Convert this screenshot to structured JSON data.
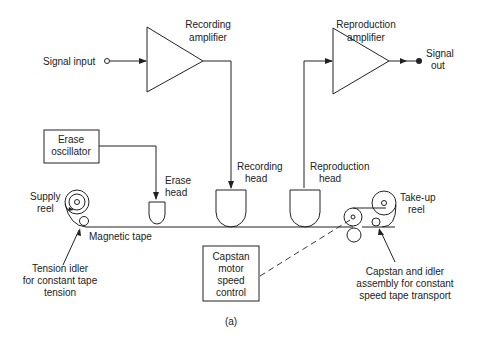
{
  "diagram": {
    "caption": "(a)",
    "amplifiers": {
      "recording": {
        "line1": "Recording",
        "line2": "amplifier"
      },
      "reproduction": {
        "line1": "Reproduction",
        "line2": "amplifier"
      }
    },
    "signals": {
      "input": "Signal input",
      "output_line1": "Signal",
      "output_line2": "out"
    },
    "erase_oscillator": {
      "line1": "Erase",
      "line2": "oscillator"
    },
    "heads": {
      "erase": {
        "line1": "Erase",
        "line2": "head"
      },
      "recording": {
        "line1": "Recording",
        "line2": "head"
      },
      "reproduction": {
        "line1": "Reproduction",
        "line2": "head"
      }
    },
    "reels": {
      "supply": {
        "line1": "Supply",
        "line2": "reel"
      },
      "takeup": {
        "line1": "Take-up",
        "line2": "reel"
      }
    },
    "tape_label": "Magnetic tape",
    "capstan_control": {
      "line1": "Capstan",
      "line2": "motor",
      "line3": "speed",
      "line4": "control"
    },
    "tension_idler": {
      "line1": "Tension idler",
      "line2": "for constant tape",
      "line3": "tension"
    },
    "capstan_assembly": {
      "line1": "Capstan and idler",
      "line2": "assembly for constant",
      "line3": "speed tape transport"
    }
  }
}
